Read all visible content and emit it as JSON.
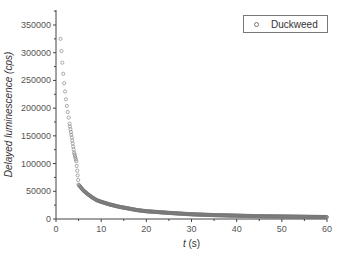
{
  "chart_data": {
    "type": "scatter",
    "title": "",
    "xlabel": "t (s)",
    "xlabel_italic_part": "t",
    "xlabel_unit": " (s)",
    "ylabel": "Delayed luminescence (cps)",
    "xlim": [
      0,
      60
    ],
    "ylim": [
      0,
      370000
    ],
    "x_ticks": [
      0,
      10,
      20,
      30,
      40,
      50,
      60
    ],
    "y_ticks": [
      0,
      50000,
      100000,
      150000,
      200000,
      250000,
      300000,
      350000
    ],
    "grid": false,
    "legend_position": "upper right",
    "series": [
      {
        "name": "Duckweed",
        "marker": "open-circle",
        "color": "#777777",
        "model": "approx. hyperbolic decay ~ 325000 / t",
        "x": [
          1,
          1.2,
          1.4,
          1.6,
          1.8,
          2,
          2.2,
          2.4,
          2.6,
          2.8,
          3,
          3.5,
          4,
          4.5,
          5,
          6,
          7,
          8,
          9,
          10,
          12,
          14,
          16,
          18,
          20,
          25,
          30,
          35,
          40,
          45,
          50,
          55,
          60
        ],
        "y": [
          325000,
          303000,
          282000,
          262000,
          245000,
          230000,
          216000,
          204000,
          193000,
          183000,
          172000,
          147000,
          120000,
          104000,
          62000,
          52000,
          45000,
          39000,
          34000,
          31000,
          26000,
          22000,
          19000,
          16000,
          14000,
          11000,
          8500,
          7000,
          6000,
          5000,
          4500,
          4000,
          3500
        ]
      }
    ]
  },
  "legend": {
    "items": [
      {
        "label": "Duckweed"
      }
    ]
  }
}
